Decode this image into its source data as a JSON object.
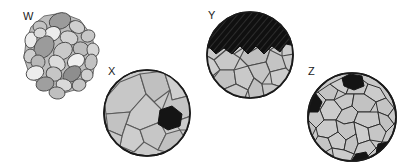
{
  "figure": {
    "background_color": "#ffffff",
    "width": 403,
    "height": 168
  },
  "palette": {
    "outline": "#1a1a1a",
    "grain_outline": "#3a3a3a",
    "grain_light": "#d8d8d8",
    "grain_mid": "#c2c2c2",
    "grain_dark": "#9b9b9b",
    "grain_darker": "#868686",
    "grain_pale": "#ececec",
    "opaque_black": "#141414",
    "label_color": "#1a1a1a"
  },
  "specimens": [
    {
      "id": "w",
      "label": "W",
      "label_x": 23,
      "label_y": 11,
      "description": "Rounded clastic grains, poorly sorted clast cluster",
      "shape": "irregular-cluster",
      "x": 20,
      "y": 8,
      "width": 80,
      "height": 85,
      "grain_count": 25,
      "has_opaque": false
    },
    {
      "id": "x",
      "label": "X",
      "label_x": 108,
      "label_y": 66,
      "description": "Coarse interlocking crystalline grains in circular section",
      "shape": "circle",
      "center_x": 147,
      "center_y": 113,
      "radius": 43,
      "grain_count": 13,
      "has_opaque": true,
      "opaque_count": 1
    },
    {
      "id": "y",
      "label": "Y",
      "label_x": 208,
      "label_y": 10,
      "description": "Interlocking grains with hatched opaque band across top",
      "shape": "circle",
      "center_x": 250,
      "center_y": 55,
      "radius": 43,
      "grain_count": 18,
      "has_opaque": true,
      "opaque_count": 1,
      "opaque_hatched": true
    },
    {
      "id": "z",
      "label": "Z",
      "label_x": 308,
      "label_y": 66,
      "description": "Fine interlocking grains with scattered opaque patches",
      "shape": "circle",
      "center_x": 352,
      "center_y": 117,
      "radius": 44,
      "grain_count": 38,
      "has_opaque": true,
      "opaque_count": 4
    }
  ]
}
